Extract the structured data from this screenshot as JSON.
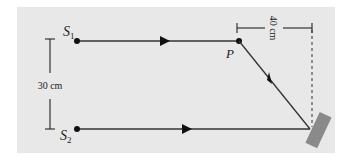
{
  "diagram": {
    "background_color": "#e8e8e8",
    "line_color": "#333333",
    "mirror_color": "#8a8a8a",
    "labels": {
      "source1": "S",
      "source1_sub": "1",
      "source2": "S",
      "source2_sub": "2",
      "point_p": "P",
      "vertical_dimension": "30 cm",
      "horizontal_dimension": "40 cm"
    }
  }
}
